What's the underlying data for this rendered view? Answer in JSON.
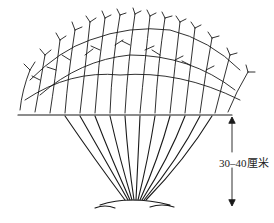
{
  "figure": {
    "cut_line_label": "",
    "height_annotation": "30–40厘米",
    "colors": {
      "ink": "#1a1a1a",
      "background": "#ffffff"
    }
  }
}
